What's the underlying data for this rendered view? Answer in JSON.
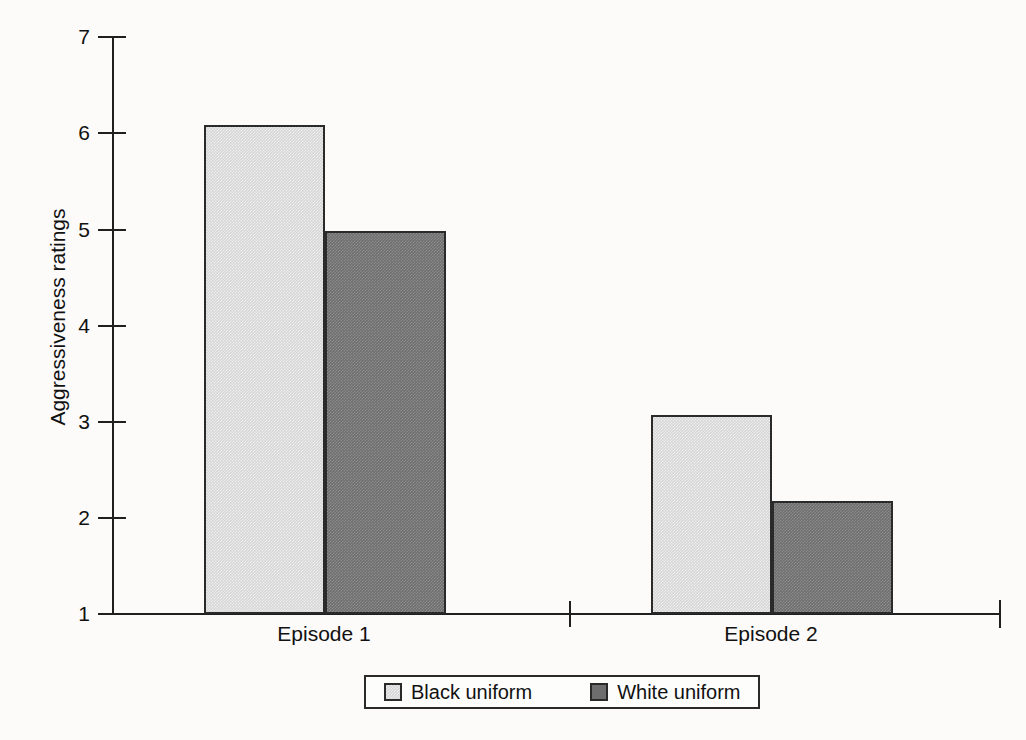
{
  "chart_data": {
    "type": "bar",
    "title": "",
    "subtitle": "",
    "xlabel": "",
    "ylabel": "Aggressiveness ratings",
    "categories": [
      "Episode 1",
      "Episode 2"
    ],
    "series": [
      {
        "name": "Black uniform",
        "color": "#d6d6d6",
        "values": [
          6.08,
          3.07
        ]
      },
      {
        "name": "White uniform",
        "color": "#6e6e6e",
        "values": [
          4.98,
          2.17
        ]
      }
    ],
    "ylim": [
      1,
      7
    ],
    "y_ticks": [
      1,
      2,
      3,
      4,
      5,
      6,
      7
    ],
    "y_tick_labels": [
      "1",
      "2",
      "3",
      "4",
      "5",
      "6",
      "7"
    ],
    "grid": false,
    "legend_position": "bottom-center",
    "legend_entries": [
      "Black uniform",
      "White uniform"
    ]
  },
  "axes": {
    "y_title": "Aggressiveness ratings",
    "ticks": {
      "t7": "7",
      "t6": "6",
      "t5": "5",
      "t4": "4",
      "t3": "3",
      "t2": "2",
      "t1": "1"
    }
  },
  "categories": {
    "c0": "Episode 1",
    "c1": "Episode 2"
  },
  "legend": {
    "items": [
      {
        "label": "Black uniform"
      },
      {
        "label": "White uniform"
      }
    ]
  },
  "colors": {
    "background": "#fcfbfa",
    "axis": "#1f1f1f",
    "bar_light": "#d6d6d6",
    "bar_dark": "#6e6e6e",
    "bar_outline": "#2a2a2a",
    "text": "#111111"
  }
}
